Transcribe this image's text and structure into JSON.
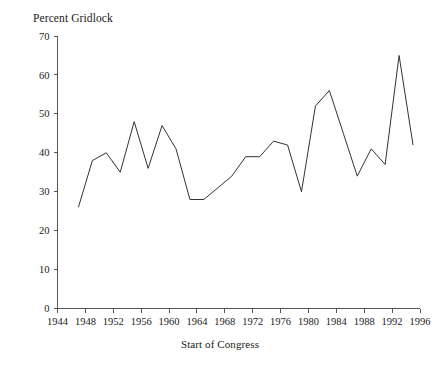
{
  "figure": {
    "ylabel_top": "Percent Gridlock",
    "xlabel_bottom": "Start of Congress",
    "line_color": "#333333",
    "axis_color": "#555555",
    "background": "#ffffff"
  },
  "axes": {
    "y_ticks": [
      "0",
      "10",
      "20",
      "30",
      "40",
      "50",
      "60",
      "70"
    ],
    "x_ticks": [
      "1944",
      "1948",
      "1952",
      "1956",
      "1960",
      "1964",
      "1968",
      "1972",
      "1976",
      "1980",
      "1984",
      "1988",
      "1992",
      "1996"
    ]
  },
  "chart_data": {
    "type": "line",
    "title": "",
    "subtitle": "",
    "xlabel": "Start of Congress",
    "ylabel": "Percent Gridlock",
    "ylabel_position": "top-left",
    "grid": false,
    "legend": false,
    "xlim": [
      1944,
      1996
    ],
    "ylim": [
      0,
      70
    ],
    "x_tick_step": 4,
    "y_tick_step": 10,
    "x": [
      1947,
      1949,
      1951,
      1953,
      1955,
      1957,
      1959,
      1961,
      1963,
      1965,
      1967,
      1969,
      1971,
      1973,
      1975,
      1977,
      1979,
      1981,
      1983,
      1985,
      1987,
      1989,
      1991,
      1993,
      1995
    ],
    "values": [
      26,
      38,
      40,
      35,
      48,
      36,
      47,
      41,
      28,
      28,
      31,
      34,
      39,
      39,
      43,
      42,
      30,
      52,
      56,
      45,
      34,
      41,
      37,
      65,
      42
    ],
    "series": [
      {
        "name": "Percent Gridlock",
        "values": [
          26,
          38,
          40,
          35,
          48,
          36,
          47,
          41,
          28,
          28,
          31,
          34,
          39,
          39,
          43,
          42,
          30,
          52,
          56,
          45,
          34,
          41,
          37,
          65,
          42
        ]
      }
    ],
    "annotations": []
  }
}
